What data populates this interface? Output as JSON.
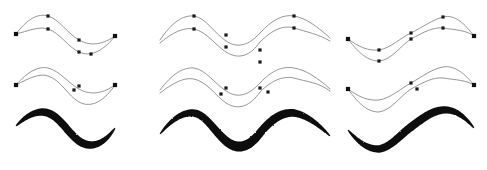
{
  "figure": {
    "background_color": "#ffffff",
    "width": 487,
    "height": 170,
    "grid": {
      "columns": 3,
      "rows": 3
    },
    "row_labels": [
      "dense control point skeleton",
      "sparse control point skeleton",
      "rendered calligraphic brush stroke"
    ],
    "column_labels": [
      "single period wave",
      "double period wave",
      "inverted phase wave"
    ]
  },
  "style": {
    "guide_curve_color": "#8a8a8a",
    "guide_curve_width": 0.9,
    "node_marker_color": "#1a1a1a",
    "node_marker_size": 3.2,
    "endpoint_marker_size": 4.2,
    "brush_fill_color": "#0d0d0d"
  },
  "chart_data": {
    "type": "line",
    "xlabel": "",
    "ylabel": "",
    "grid": false,
    "legend": "none",
    "xlim": [
      0,
      487
    ],
    "ylim": [
      0,
      170
    ],
    "panels": [
      {
        "id": "col1-row1",
        "stage": "dense control point skeleton",
        "column": 1,
        "row": 1,
        "curves": [
          {
            "name": "upper-guide",
            "path": "M 16 34 C 27 19, 38 13, 48 16 C 59 19, 68 34, 79 40 C 91 47, 104 44, 115 36",
            "nodes": [
              {
                "x": 16,
                "y": 34,
                "type": "endpoint"
              },
              {
                "x": 48,
                "y": 16,
                "type": "control"
              },
              {
                "x": 79,
                "y": 40,
                "type": "control"
              },
              {
                "x": 115,
                "y": 36,
                "type": "endpoint"
              }
            ]
          },
          {
            "name": "lower-guide",
            "path": "M 16 34 C 28 31, 39 26, 48 29, C 60 33, 68 47, 79 52 C 92 58, 105 49, 115 36",
            "nodes": [
              {
                "x": 48,
                "y": 29,
                "type": "control"
              },
              {
                "x": 79,
                "y": 52,
                "type": "control"
              },
              {
                "x": 91,
                "y": 54,
                "type": "control"
              }
            ]
          }
        ]
      },
      {
        "id": "col2-row1",
        "stage": "dense control point skeleton",
        "column": 2,
        "row": 1,
        "curves": [
          {
            "name": "upper-guide",
            "path": "M 160 40 C 172 22, 183 15, 194 16 C 206 18, 214 33, 226 41 C 238 49, 249 45, 260 33 C 272 20, 283 14, 294 16 C 306 18, 318 27, 330 38",
            "nodes": [
              {
                "x": 194,
                "y": 16,
                "type": "control"
              },
              {
                "x": 226,
                "y": 35,
                "type": "control"
              },
              {
                "x": 260,
                "y": 50,
                "type": "control"
              },
              {
                "x": 294,
                "y": 16,
                "type": "control"
              }
            ]
          },
          {
            "name": "lower-guide",
            "path": "M 160 43 C 173 32, 184 27, 194 29 C 207 32, 215 45, 226 52 C 239 60, 250 56, 260 42 C 273 29, 284 25, 294 28 C 307 32, 318 34, 330 41",
            "nodes": [
              {
                "x": 194,
                "y": 29,
                "type": "control"
              },
              {
                "x": 226,
                "y": 47,
                "type": "control"
              },
              {
                "x": 260,
                "y": 62,
                "type": "control"
              },
              {
                "x": 294,
                "y": 28,
                "type": "control"
              }
            ]
          }
        ]
      },
      {
        "id": "col3-row1",
        "stage": "dense control point skeleton",
        "column": 3,
        "row": 1,
        "curves": [
          {
            "name": "upper-guide",
            "path": "M 348 39 C 359 47, 368 51, 379 50 C 391 48, 400 38, 411 33 C 423 27, 432 20, 443 17 C 455 14, 465 24, 474 36",
            "nodes": [
              {
                "x": 348,
                "y": 39,
                "type": "endpoint"
              },
              {
                "x": 379,
                "y": 50,
                "type": "control"
              },
              {
                "x": 411,
                "y": 33,
                "type": "control"
              },
              {
                "x": 443,
                "y": 17,
                "type": "control"
              },
              {
                "x": 474,
                "y": 36,
                "type": "endpoint"
              }
            ]
          },
          {
            "name": "lower-guide",
            "path": "M 348 39 C 360 55, 369 61, 379 61 C 392 60, 401 45, 411 39 C 424 32, 433 27, 443 28 C 456 30, 466 30, 474 36",
            "nodes": [
              {
                "x": 379,
                "y": 61,
                "type": "control"
              },
              {
                "x": 411,
                "y": 39,
                "type": "control"
              },
              {
                "x": 443,
                "y": 28,
                "type": "control"
              }
            ]
          }
        ]
      },
      {
        "id": "col1-row2",
        "stage": "sparse control point skeleton",
        "column": 1,
        "row": 2,
        "curves": [
          {
            "name": "upper-guide",
            "path": "M 16 85 C 28 71, 39 66, 48 68 C 60 71, 68 83, 79 89 C 91 96, 104 93, 115 85",
            "nodes": [
              {
                "x": 16,
                "y": 85,
                "type": "endpoint"
              },
              {
                "x": 79,
                "y": 86,
                "type": "control"
              },
              {
                "x": 115,
                "y": 85,
                "type": "endpoint"
              }
            ]
          },
          {
            "name": "lower-guide",
            "path": "M 16 85 C 29 78, 40 73, 48 76 C 61 80, 68 96, 79 102 C 92 109, 105 100, 115 85",
            "nodes": [
              {
                "x": 74,
                "y": 90,
                "type": "control"
              }
            ]
          }
        ]
      },
      {
        "id": "col2-row2",
        "stage": "sparse control point skeleton",
        "column": 2,
        "row": 2,
        "curves": [
          {
            "name": "upper-guide",
            "path": "M 160 90 C 172 74, 183 67, 194 68 C 206 70, 214 83, 226 91 C 238 99, 249 95, 260 83 C 272 70, 283 66, 294 68 C 306 70, 318 78, 330 89",
            "nodes": [
              {
                "x": 226,
                "y": 88,
                "type": "control"
              },
              {
                "x": 260,
                "y": 88,
                "type": "control"
              }
            ]
          },
          {
            "name": "lower-guide",
            "path": "M 160 93 C 173 83, 184 77, 194 79 C 207 82, 215 95, 226 103 C 239 111, 250 106, 260 92 C 273 79, 284 76, 294 78 C 307 82, 318 82, 330 91",
            "nodes": [
              {
                "x": 221,
                "y": 94,
                "type": "control"
              },
              {
                "x": 268,
                "y": 92,
                "type": "control"
              }
            ]
          }
        ]
      },
      {
        "id": "col3-row2",
        "stage": "sparse control point skeleton",
        "column": 3,
        "row": 2,
        "curves": [
          {
            "name": "upper-guide",
            "path": "M 348 89 C 359 97, 368 101, 379 100 C 391 98, 400 89, 411 83 C 423 76, 432 69, 443 67 C 455 65, 465 74, 474 85",
            "nodes": [
              {
                "x": 348,
                "y": 89,
                "type": "endpoint"
              },
              {
                "x": 411,
                "y": 83,
                "type": "control"
              },
              {
                "x": 474,
                "y": 85,
                "type": "endpoint"
              }
            ]
          },
          {
            "name": "lower-guide",
            "path": "M 348 89 C 360 106, 369 112, 379 112 C 392 110, 401 95, 411 89 C 424 82, 433 77, 443 78 C 456 80, 466 80, 474 85",
            "nodes": [
              {
                "x": 417,
                "y": 89,
                "type": "control"
              }
            ]
          }
        ]
      },
      {
        "id": "col1-row3",
        "stage": "rendered calligraphic brush stroke",
        "column": 1,
        "row": 3,
        "stroke": {
          "name": "brush-stroke-1",
          "min_width": 1,
          "max_width": 9,
          "centerline": "M 16 126 C 28 114, 39 110, 48 113 C 60 117, 68 133, 79 141 C 92 150, 105 143, 115 128"
        }
      },
      {
        "id": "col2-row3",
        "stage": "rendered calligraphic brush stroke",
        "column": 2,
        "row": 3,
        "stroke": {
          "name": "brush-stroke-2",
          "min_width": 1,
          "max_width": 10,
          "centerline": "M 160 134 C 172 119, 183 112, 194 113 C 206 115, 214 131, 226 141 C 238 151, 249 147, 260 133 C 272 118, 283 112, 294 113 C 306 115, 318 124, 330 136"
        }
      },
      {
        "id": "col3-row3",
        "stage": "rendered calligraphic brush stroke",
        "column": 3,
        "row": 3,
        "stroke": {
          "name": "brush-stroke-3",
          "min_width": 1,
          "max_width": 9,
          "centerline": "M 348 130 C 359 143, 368 149, 379 149 C 391 147, 400 135, 411 127 C 423 118, 432 111, 443 110 C 455 109, 465 117, 474 128"
        }
      }
    ]
  }
}
